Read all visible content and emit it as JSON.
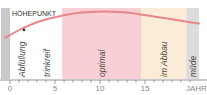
{
  "chart_data": {
    "type": "line",
    "title": "HÖHEPUNKT",
    "xlabel": "JAHRE",
    "ylabel": "",
    "xlim": [
      -1,
      21
    ],
    "ylim": [
      0,
      1
    ],
    "x_ticks": [
      0,
      5,
      10,
      15
    ],
    "x_tick_labels": [
      "0",
      "5",
      "10",
      "15"
    ],
    "minor_tick_step": 1,
    "grid": false,
    "series": [
      {
        "name": "Qualität",
        "color": "#e8868a",
        "x": [
          -0.5,
          0,
          1,
          2,
          3,
          4,
          5,
          6,
          7,
          8,
          9,
          10,
          11,
          12,
          13,
          14,
          15,
          16,
          17,
          18,
          19,
          20,
          21
        ],
        "y": [
          0.58,
          0.62,
          0.69,
          0.75,
          0.8,
          0.84,
          0.87,
          0.9,
          0.92,
          0.935,
          0.945,
          0.95,
          0.95,
          0.945,
          0.935,
          0.92,
          0.9,
          0.88,
          0.86,
          0.84,
          0.82,
          0.8,
          0.78
        ]
      }
    ],
    "marker": {
      "x": 1.5,
      "label": "Abfüllung"
    },
    "zones": [
      {
        "label": "",
        "from": -1.0,
        "to": 0.0,
        "color": "#c9c9c9"
      },
      {
        "label": "Abfüllung",
        "from": 0.0,
        "to": 2.7,
        "color": "#ffffff"
      },
      {
        "label": "trinkreif",
        "from": 2.7,
        "to": 5.8,
        "color": "#ffffff"
      },
      {
        "label": "optimal",
        "from": 5.8,
        "to": 14.6,
        "color": "#f8cfd4"
      },
      {
        "label": "im Abbau",
        "from": 14.6,
        "to": 19.6,
        "color": "#faecd6"
      },
      {
        "label": "müde",
        "from": 19.6,
        "to": 21.0,
        "color": "#dcdcdc"
      }
    ]
  }
}
